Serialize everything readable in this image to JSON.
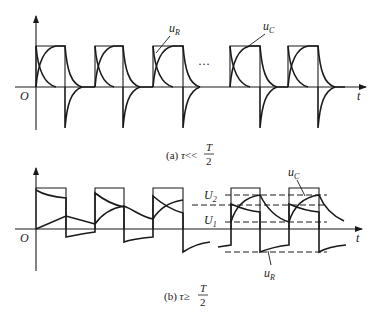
{
  "figure": {
    "panel_a": {
      "caption_prefix": "(a) ",
      "caption_tau": "τ",
      "caption_relation": "<<",
      "caption_num": "T",
      "caption_den": "2",
      "origin_label": "O",
      "time_label": "t",
      "ellipsis": "···",
      "label_uR": "u",
      "label_uR_sub": "R",
      "label_uC": "u",
      "label_uC_sub": "C",
      "pulses": [
        [
          36,
          65
        ],
        [
          95,
          123
        ],
        [
          153,
          183
        ],
        [
          230,
          260
        ],
        [
          288,
          318
        ]
      ]
    },
    "panel_b": {
      "caption_prefix": "(b) ",
      "caption_tau": "τ",
      "caption_relation": "≥",
      "caption_num": "T",
      "caption_den": "2",
      "origin_label": "O",
      "time_label": "t",
      "label_U2": "U",
      "label_U2_sub": "2",
      "label_U1": "U",
      "label_U1_sub": "1",
      "label_uR": "u",
      "label_uR_sub": "R",
      "label_uC": "u",
      "label_uC_sub": "C",
      "pulses": [
        [
          36,
          66
        ],
        [
          95,
          124
        ],
        [
          153,
          183
        ],
        [
          231,
          260
        ],
        [
          289,
          319
        ]
      ]
    },
    "colors": {
      "ink": "#1a1a1a",
      "background": "#ffffff"
    }
  }
}
